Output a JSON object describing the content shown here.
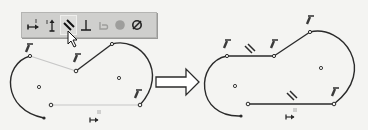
{
  "toolbar": {
    "buttons": [
      {
        "name": "horizontal-constraint",
        "icon": "horizontal-dimension-icon",
        "state": "normal"
      },
      {
        "name": "vertical-constraint",
        "icon": "vertical-dimension-icon",
        "state": "normal"
      },
      {
        "name": "parallel-constraint",
        "icon": "parallel-icon",
        "state": "hover"
      },
      {
        "name": "perpendicular-constraint",
        "icon": "perpendicular-icon",
        "state": "normal"
      },
      {
        "name": "tangent-constraint",
        "icon": "tangent-icon",
        "state": "disabled"
      },
      {
        "name": "concentric-constraint",
        "icon": "concentric-icon",
        "state": "disabled"
      },
      {
        "name": "fix-constraint",
        "icon": "fix-icon",
        "state": "normal"
      }
    ],
    "background": "#cfcfcd"
  },
  "sketch_before": {
    "label": "before",
    "line_color": "#2a2a2a",
    "preview_line_color": "#bdbdbd"
  },
  "sketch_after": {
    "label": "after",
    "line_color": "#2a2a2a"
  },
  "transition_arrow": {
    "icon": "right-arrow-icon"
  },
  "colors": {
    "background": "#f4f4f2",
    "geometry": "#2a2a2a",
    "construction": "#c0c0c0",
    "glyph": "#3a3a3a"
  }
}
